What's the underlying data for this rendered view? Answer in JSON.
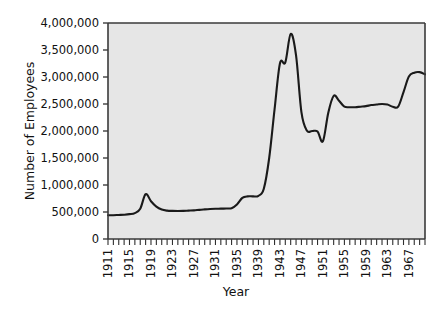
{
  "chart_data": {
    "type": "line",
    "title": "",
    "xlabel": "Year",
    "ylabel": "Number of Employees",
    "xlim": [
      1911,
      1970
    ],
    "ylim": [
      0,
      4000000
    ],
    "grid": false,
    "legend": null,
    "y_ticks": [
      0,
      500000,
      1000000,
      1500000,
      2000000,
      2500000,
      3000000,
      3500000,
      4000000
    ],
    "y_tick_labels": [
      "0",
      "500,000",
      "1,000,000",
      "1,500,000",
      "2,000,000",
      "2,500,000",
      "3,000,000",
      "3,500,000",
      "4,000,000"
    ],
    "x_ticks": [
      1911,
      1915,
      1919,
      1923,
      1927,
      1931,
      1935,
      1939,
      1943,
      1947,
      1951,
      1955,
      1959,
      1963,
      1967
    ],
    "x_tick_labels": [
      "1911",
      "1915",
      "1919",
      "1923",
      "1927",
      "1931",
      "1935",
      "1939",
      "1943",
      "1947",
      "1951",
      "1955",
      "1959",
      "1963",
      "1967"
    ],
    "x_minor_tick_interval": 1,
    "series": [
      {
        "name": "Number of Employees",
        "color": "#1a1a1a",
        "x": [
          1911,
          1912,
          1913,
          1914,
          1915,
          1916,
          1917,
          1918,
          1919,
          1920,
          1921,
          1922,
          1923,
          1924,
          1925,
          1926,
          1927,
          1928,
          1929,
          1930,
          1931,
          1932,
          1933,
          1934,
          1935,
          1936,
          1937,
          1938,
          1939,
          1940,
          1941,
          1942,
          1943,
          1944,
          1945,
          1946,
          1947,
          1948,
          1949,
          1950,
          1951,
          1952,
          1953,
          1954,
          1955,
          1956,
          1957,
          1958,
          1959,
          1960,
          1961,
          1962,
          1963,
          1964,
          1965,
          1966,
          1967,
          1968,
          1969,
          1970
        ],
        "values": [
          440000,
          440000,
          445000,
          450000,
          460000,
          480000,
          560000,
          830000,
          700000,
          600000,
          545000,
          525000,
          520000,
          518000,
          520000,
          525000,
          530000,
          540000,
          548000,
          555000,
          560000,
          562000,
          565000,
          570000,
          640000,
          760000,
          790000,
          790000,
          800000,
          930000,
          1500000,
          2400000,
          3250000,
          3270000,
          3800000,
          3400000,
          2350000,
          2010000,
          2000000,
          1990000,
          1810000,
          2340000,
          2650000,
          2560000,
          2450000,
          2440000,
          2440000,
          2450000,
          2460000,
          2480000,
          2490000,
          2500000,
          2490000,
          2450000,
          2450000,
          2720000,
          3010000,
          3080000,
          3090000,
          3050000
        ],
        "annotations": {
          "wwi_peak": {
            "year": 1918,
            "value": 830000
          },
          "wwii_shoulder": {
            "year": 1943,
            "value": 3250000
          },
          "wwii_peak": {
            "year": 1945,
            "value": 3800000
          },
          "postwar_trough": {
            "year": 1951,
            "value": 1810000
          },
          "korea_peak": {
            "year": 1953,
            "value": 2650000
          },
          "vietnam_peak": {
            "year": 1969,
            "value": 3090000
          }
        }
      }
    ]
  },
  "colors": {
    "plot_background": "#e6e6e6",
    "page_background": "#ffffff",
    "line": "#1a1a1a",
    "axis": "#3a3a3a",
    "text": "#111111"
  }
}
